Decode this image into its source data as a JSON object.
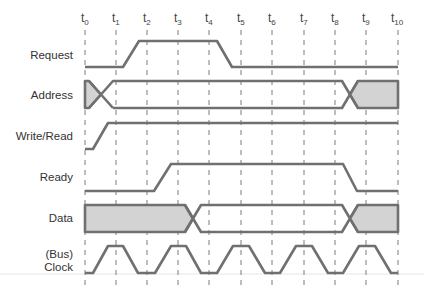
{
  "diagram": {
    "type": "timing-diagram",
    "time_labels": [
      {
        "base": "t",
        "sub": "0"
      },
      {
        "base": "t",
        "sub": "1"
      },
      {
        "base": "t",
        "sub": "2"
      },
      {
        "base": "t",
        "sub": "3"
      },
      {
        "base": "t",
        "sub": "4"
      },
      {
        "base": "t",
        "sub": "5"
      },
      {
        "base": "t",
        "sub": "6"
      },
      {
        "base": "t",
        "sub": "7"
      },
      {
        "base": "t",
        "sub": "8"
      },
      {
        "base": "t",
        "sub": "9"
      },
      {
        "base": "t",
        "sub": "10"
      }
    ],
    "signals": [
      {
        "name": "Request",
        "label_lines": [
          "Request"
        ],
        "kind": "level",
        "description": "low t0..~t1.2, rises to high by ~t1.7, high until ~t4.1, falls to low by ~t4.6, low to t10"
      },
      {
        "name": "Address",
        "label_lines": [
          "Address"
        ],
        "kind": "bus",
        "description": "invalid (shaded) at t0, transitions to valid around t0.5, valid until ~t8.2, transitions to invalid (shaded) by ~t8.8 through t10"
      },
      {
        "name": "Write/Read",
        "label_lines": [
          "Write/Read"
        ],
        "kind": "level",
        "description": "low at t0, rises to high by ~t0.9, high to t10"
      },
      {
        "name": "Ready",
        "label_lines": [
          "Ready"
        ],
        "kind": "level",
        "description": "low until ~t2.2, rises to high by ~t2.7, high until ~t8.2, falls to low by ~t8.7"
      },
      {
        "name": "Data",
        "label_lines": [
          "Data"
        ],
        "kind": "bus",
        "description": "invalid (shaded) t0..~t3.2, valid ~t3.5..~t8.2, invalid (shaded) ~t8.8..t10"
      },
      {
        "name": "(Bus) Clock",
        "label_lines": [
          "(Bus)",
          "Clock"
        ],
        "kind": "clock",
        "description": "trapezoidal clock with high pulses centered at t1, t3, t5, t7, t9"
      }
    ],
    "colors": {
      "signal_stroke": "#707070",
      "invalid_fill": "#d3d3d3",
      "guide_line": "#7d7d7d",
      "label_text": "#333333",
      "background": "#ffffff"
    }
  }
}
